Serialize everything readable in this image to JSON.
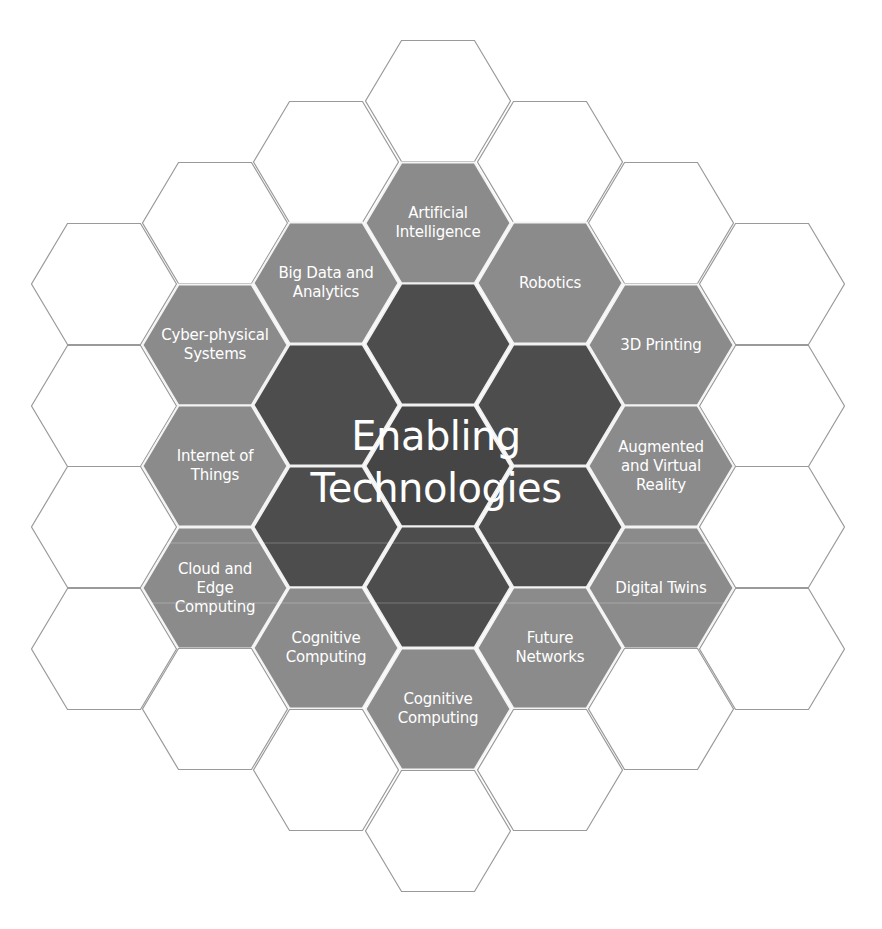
{
  "diagram": {
    "title_line1": "Enabling",
    "title_line2": "Technologies",
    "colors": {
      "background": "#ffffff",
      "outline_hex_stroke": "#9a9a9a",
      "technology_hex_fill": "#8b8b8b",
      "core_hex_fill": "#4d4d4d",
      "label_text": "#ffffff"
    },
    "technologies": [
      {
        "id": "ai",
        "label": "Artificial\nIntelligence"
      },
      {
        "id": "big-data",
        "label": "Big Data and\nAnalytics"
      },
      {
        "id": "robotics",
        "label": "Robotics"
      },
      {
        "id": "cyber-physical",
        "label": "Cyber-physical\nSystems"
      },
      {
        "id": "3d-printing",
        "label": "3D Printing"
      },
      {
        "id": "iot",
        "label": "Internet of\nThings"
      },
      {
        "id": "ar-vr",
        "label": "Augmented\nand Virtual\nReality"
      },
      {
        "id": "cloud-edge",
        "label": "Cloud and\nEdge\nComputing"
      },
      {
        "id": "digital-twins",
        "label": "Digital Twins"
      },
      {
        "id": "cognitive-left",
        "label": "Cognitive\nComputing"
      },
      {
        "id": "future-networks",
        "label": "Future\nNetworks"
      },
      {
        "id": "cognitive-bottom",
        "label": "Cognitive\nComputing"
      }
    ]
  }
}
